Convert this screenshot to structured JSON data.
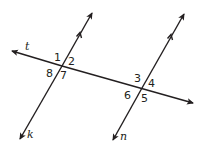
{
  "diagram": {
    "type": "parallel lines cut by a transversal",
    "colors": {
      "line": "#231f20",
      "background": "#ffffff"
    },
    "lines": {
      "t": {
        "label": "t",
        "role": "transversal"
      },
      "k": {
        "label": "k",
        "role": "parallel line"
      },
      "n": {
        "label": "n",
        "role": "parallel line"
      }
    },
    "angles": {
      "intersection_k": [
        "1",
        "2",
        "7",
        "8"
      ],
      "intersection_n": [
        "3",
        "4",
        "5",
        "6"
      ],
      "a1": "1",
      "a2": "2",
      "a3": "3",
      "a4": "4",
      "a5": "5",
      "a6": "6",
      "a7": "7",
      "a8": "8"
    }
  }
}
